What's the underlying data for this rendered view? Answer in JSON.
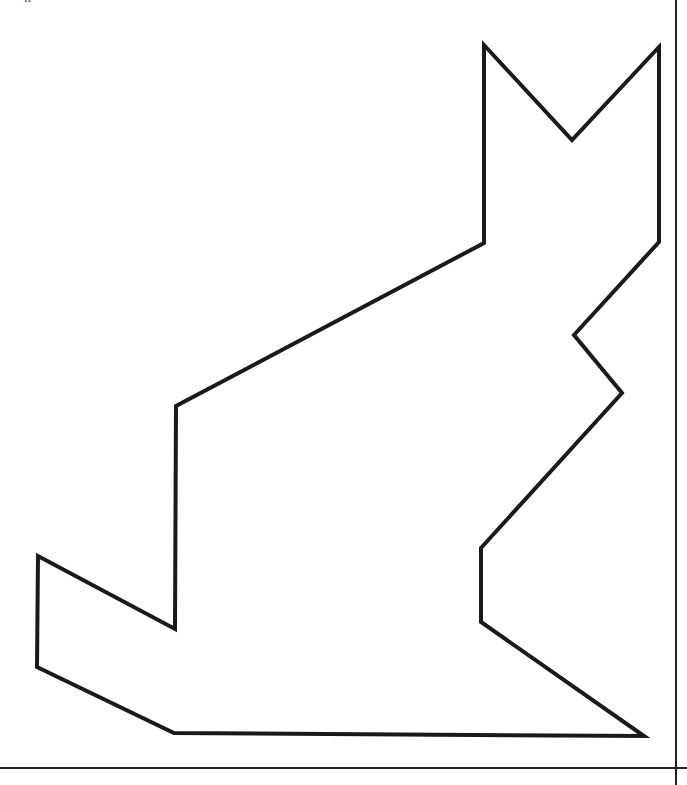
{
  "figure": {
    "type": "tangram-outline",
    "cut_text_fragment": "..",
    "stroke_color": "#1a1a1a",
    "background": "#ffffff",
    "stroke_width": 4,
    "outline_points": [
      [
        484,
        45
      ],
      [
        572,
        140
      ],
      [
        659,
        47
      ],
      [
        659,
        242
      ],
      [
        574,
        335
      ],
      [
        622,
        393
      ],
      [
        481,
        548
      ],
      [
        481,
        622
      ],
      [
        644,
        736
      ],
      [
        174,
        733
      ],
      [
        37,
        667
      ],
      [
        38,
        556
      ],
      [
        175,
        629
      ],
      [
        176,
        406
      ],
      [
        484,
        243
      ]
    ],
    "frame": {
      "right_line_x": 676,
      "bottom_line_y": 768,
      "line_color": "#222222"
    }
  }
}
